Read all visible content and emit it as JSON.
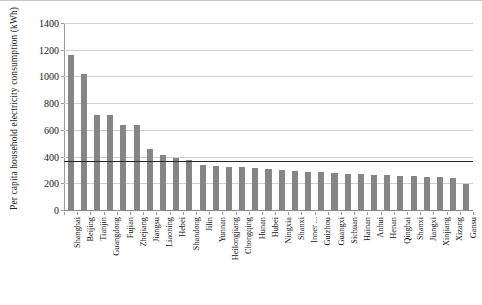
{
  "chart_data": {
    "type": "bar",
    "title": "",
    "xlabel": "",
    "ylabel": "Per capita household electricity consumption (kWh)",
    "ylim": [
      0,
      1400
    ],
    "ytick_labels": [
      "0",
      "200",
      "400",
      "600",
      "800",
      "1000",
      "1200",
      "1400"
    ],
    "ytick_values": [
      0,
      200,
      400,
      600,
      800,
      1000,
      1200,
      1400
    ],
    "grid": true,
    "legend": "none",
    "categories": [
      "Shanghai",
      "Beijing",
      "Tianjin",
      "Guangdong",
      "Fujian",
      "Zhejiang",
      "Jiangsu",
      "Liaoning",
      "Hebei",
      "Shandong",
      "Jilin",
      "Yunnan",
      "Heilongjiang",
      "Chongqing",
      "Hunan",
      "Hubei",
      "Ningxia",
      "Shanxi",
      "Inner ...",
      "Guizhou",
      "Guangxi",
      "Sichuan",
      "Hainan",
      "Anhui",
      "Henan",
      "Qinghai",
      "Shanxi",
      "Jiangxi",
      "Xinjiang",
      "Xizang",
      "Gansu"
    ],
    "values": [
      1160,
      1020,
      710,
      710,
      635,
      635,
      455,
      410,
      390,
      378,
      340,
      330,
      325,
      320,
      315,
      310,
      300,
      292,
      288,
      282,
      278,
      272,
      268,
      265,
      262,
      258,
      255,
      250,
      248,
      238,
      195
    ],
    "annotations": [
      {
        "name": "national-average-line",
        "type": "hline",
        "value": 370
      }
    ],
    "series_color": "#858585",
    "reference_line_color": "#262626"
  }
}
